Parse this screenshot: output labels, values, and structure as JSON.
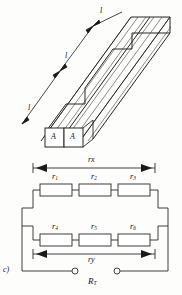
{
  "figure": {
    "part_label": "c)",
    "solid": {
      "length_labels": [
        "l",
        "l",
        "l"
      ],
      "area_labels": [
        "A",
        "A"
      ]
    },
    "circuit": {
      "resistors_top": [
        "r",
        "r",
        "r"
      ],
      "resistors_top_sub": [
        "1",
        "2",
        "3"
      ],
      "resistors_bottom": [
        "r",
        "r",
        "r"
      ],
      "resistors_bottom_sub": [
        "4",
        "5",
        "6"
      ],
      "dimension_top": "rx",
      "dimension_bottom": "ry",
      "total_resistance": "R",
      "total_resistance_sub": "T"
    },
    "colors": {
      "line": "#2b2b2b",
      "hatch": "#555555",
      "background": "#fdfdfc"
    }
  }
}
